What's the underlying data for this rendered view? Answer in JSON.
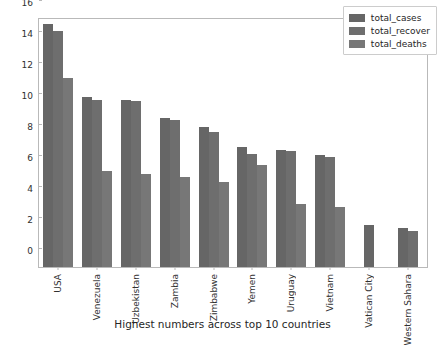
{
  "chart_data": {
    "type": "bar",
    "title": "",
    "xlabel": "Highest numbers across top 10 countries",
    "ylabel": "",
    "ylim": [
      0,
      16
    ],
    "yticks": [
      0,
      2,
      4,
      6,
      8,
      10,
      12,
      14,
      16
    ],
    "grid": false,
    "legend_position": "upper right",
    "categories": [
      "USA",
      "Venezuela",
      "Uzbekistan",
      "Zambia",
      "Zimbabwe",
      "Yemen",
      "Uruguay",
      "Vietnam",
      "Vatican City",
      "Western Sahara"
    ],
    "series": [
      {
        "name": "total_cases",
        "color": "#666666",
        "values": [
          15.7,
          11.0,
          10.8,
          9.6,
          9.05,
          7.75,
          7.55,
          7.2,
          2.7,
          2.5
        ]
      },
      {
        "name": "total_recover",
        "color": "#6e6e6e",
        "values": [
          15.2,
          10.8,
          10.7,
          9.5,
          8.7,
          7.3,
          7.5,
          7.1,
          0,
          2.35
        ]
      },
      {
        "name": "total_deaths",
        "color": "#777777",
        "values": [
          12.2,
          6.2,
          6.0,
          5.8,
          5.5,
          6.6,
          4.05,
          3.85,
          0,
          0
        ]
      }
    ]
  },
  "legend": {
    "items": [
      {
        "label": "total_cases"
      },
      {
        "label": "total_recover"
      },
      {
        "label": "total_deaths"
      }
    ]
  }
}
